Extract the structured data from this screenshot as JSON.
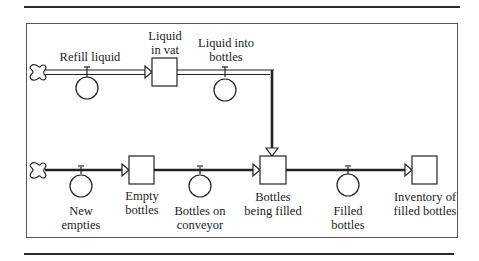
{
  "diagram": {
    "type": "stock-and-flow",
    "top_flow": {
      "source_cloud": "cloud-icon",
      "inflow": {
        "label": "Refill  liquid"
      },
      "stock": {
        "label_line1": "Liquid",
        "label_line2": "in vat"
      },
      "outflow": {
        "label_line1": "Liquid into",
        "label_line2": "bottles"
      }
    },
    "bottom_flow": {
      "source_cloud": "cloud-icon",
      "flow1": {
        "label_line1": "New",
        "label_line2": "empties"
      },
      "stock1": {
        "label_line1": "Empty",
        "label_line2": "bottles"
      },
      "flow2": {
        "label_line1": "Bottles on",
        "label_line2": "conveyor"
      },
      "stock2": {
        "label_line1": "Bottles",
        "label_line2": "being filled"
      },
      "flow3": {
        "label_line1": "Filled",
        "label_line2": "bottles"
      },
      "stock3": {
        "label_line1": "Inventory of",
        "label_line2": "filled bottles"
      }
    },
    "colors": {
      "line": "#222222",
      "pipe_fill": "#ffffff",
      "background": "#ffffff"
    }
  }
}
